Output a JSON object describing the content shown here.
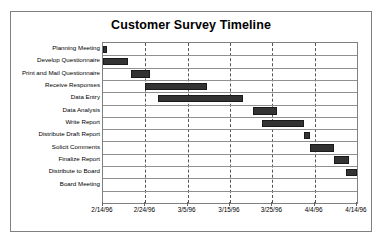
{
  "chart_data": {
    "type": "bar",
    "orientation": "horizontal",
    "subtype": "gantt",
    "title": "Customer Survey Timeline",
    "xlabel": "",
    "ylabel": "",
    "grid": "vertical-dashed",
    "legend": "none",
    "bar_color": "#333333",
    "axis_color": "#808080",
    "xlim": [
      "2/14/96",
      "4/14/96"
    ],
    "x_tick_labels": [
      "2/14/96",
      "2/24/96",
      "3/5/96",
      "3/15/96",
      "3/25/96",
      "4/4/96",
      "4/14/96"
    ],
    "x_tick_days": [
      0,
      10,
      20,
      30,
      40,
      50,
      60
    ],
    "categories": [
      "Planning Meeting",
      "Develop Questionnaire",
      "Print and Mail Questionnaire",
      "Receive Responses",
      "Data Entry",
      "Data Analysis",
      "Write Report",
      "Distribute Draft Report",
      "Solicit Comments",
      "Finalize Report",
      "Distribute to Board",
      "Board Meeting"
    ],
    "tasks": [
      {
        "name": "Planning Meeting",
        "start_day": 0,
        "duration_days": 1,
        "start_date": "2/14/96",
        "end_date": "2/15/96"
      },
      {
        "name": "Develop Questionnaire",
        "start_day": 0,
        "duration_days": 6,
        "start_date": "2/14/96",
        "end_date": "2/20/96"
      },
      {
        "name": "Print and Mail Questionnaire",
        "start_day": 6.5,
        "duration_days": 4.5,
        "start_date": "2/20/96",
        "end_date": "2/25/96"
      },
      {
        "name": "Receive Responses",
        "start_day": 10,
        "duration_days": 14.5,
        "start_date": "2/24/96",
        "end_date": "3/10/96"
      },
      {
        "name": "Data Entry",
        "start_day": 13,
        "duration_days": 20,
        "start_date": "2/27/96",
        "end_date": "3/18/96"
      },
      {
        "name": "Data Analysis",
        "start_day": 35.5,
        "duration_days": 5.5,
        "start_date": "3/20/96",
        "end_date": "3/26/96"
      },
      {
        "name": "Write Report",
        "start_day": 37.5,
        "duration_days": 10,
        "start_date": "3/22/96",
        "end_date": "4/1/96"
      },
      {
        "name": "Distribute Draft Report",
        "start_day": 47.5,
        "duration_days": 1.5,
        "start_date": "4/1/96",
        "end_date": "4/3/96"
      },
      {
        "name": "Solicit Comments",
        "start_day": 49,
        "duration_days": 5.5,
        "start_date": "4/3/96",
        "end_date": "4/9/96"
      },
      {
        "name": "Finalize Report",
        "start_day": 54.5,
        "duration_days": 3.5,
        "start_date": "4/8/96",
        "end_date": "4/12/96"
      },
      {
        "name": "Distribute to Board",
        "start_day": 57.5,
        "duration_days": 2.5,
        "start_date": "4/11/96",
        "end_date": "4/14/96"
      },
      {
        "name": "Board Meeting",
        "start_day": 60,
        "duration_days": 0,
        "start_date": "4/14/96",
        "end_date": "4/14/96"
      }
    ]
  }
}
